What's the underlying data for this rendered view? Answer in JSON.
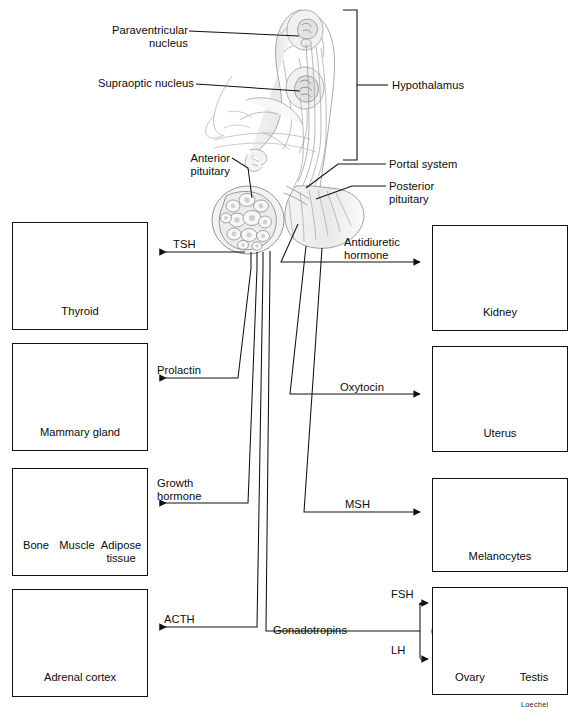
{
  "figure": {
    "signature": "Loechel",
    "line_color": "#111111",
    "box_border_color": "#111111",
    "background": "#ffffff"
  },
  "anatomy_labels": [
    {
      "id": "paraventricular-nucleus",
      "text": "Paraventricular\nnucleus",
      "align": "right",
      "x": 112,
      "y": 24
    },
    {
      "id": "supraoptic-nucleus",
      "text": "Supraoptic nucleus",
      "align": "right",
      "x": 98,
      "y": 77
    },
    {
      "id": "hypothalamus",
      "text": "Hypothalamus",
      "align": "left",
      "x": 392,
      "y": 81
    },
    {
      "id": "anterior-pituitary",
      "text": "Anterior\npituitary",
      "align": "right",
      "x": 146,
      "y": 153
    },
    {
      "id": "portal-system",
      "text": "Portal system",
      "align": "left",
      "x": 389,
      "y": 160
    },
    {
      "id": "posterior-pituitary",
      "text": "Posterior\npituitary",
      "align": "left",
      "x": 389,
      "y": 180
    }
  ],
  "hormone_labels": [
    {
      "id": "tsh",
      "text": "TSH",
      "x": 196,
      "y": 250
    },
    {
      "id": "prolactin",
      "text": "Prolactin",
      "x": 157,
      "y": 376
    },
    {
      "id": "growth-hormone",
      "text": "Growth\nhormone",
      "x": 157,
      "y": 484
    },
    {
      "id": "acth",
      "text": "ACTH",
      "x": 164,
      "y": 620
    },
    {
      "id": "antidiuretic-hormone",
      "text": "Antidiuretic\nhormone",
      "x": 344,
      "y": 251
    },
    {
      "id": "oxytocin",
      "text": "Oxytocin",
      "x": 340,
      "y": 382
    },
    {
      "id": "msh",
      "text": "MSH",
      "x": 345,
      "y": 502
    },
    {
      "id": "gonadotropins",
      "text": "Gonadotropins",
      "x": 273,
      "y": 624
    },
    {
      "id": "fsh",
      "text": "FSH",
      "x": 391,
      "y": 590
    },
    {
      "id": "lh",
      "text": "LH",
      "x": 391,
      "y": 650
    }
  ],
  "target_boxes": [
    {
      "id": "thyroid",
      "side": "left",
      "x": 12,
      "y": 222,
      "w": 136,
      "h": 108,
      "captions": [
        {
          "text": "Thyroid",
          "cx": 80,
          "y": 306
        }
      ],
      "organ": "thyroid-gland"
    },
    {
      "id": "mammary-gland",
      "side": "left",
      "x": 12,
      "y": 343,
      "w": 136,
      "h": 108,
      "captions": [
        {
          "text": "Mammary gland",
          "cx": 80,
          "y": 427
        }
      ],
      "organ": "mammary-gland"
    },
    {
      "id": "bone-muscle-adipose",
      "side": "left",
      "x": 12,
      "y": 468,
      "w": 136,
      "h": 108,
      "captions": [
        {
          "text": "Bone",
          "cx": 35,
          "y": 540
        },
        {
          "text": "Muscle",
          "cx": 76,
          "y": 540
        },
        {
          "text": "Adipose\ntissue",
          "cx": 120,
          "y": 540
        }
      ],
      "organ": "bone-muscle-adipose"
    },
    {
      "id": "adrenal-cortex",
      "side": "left",
      "x": 12,
      "y": 589,
      "w": 136,
      "h": 108,
      "captions": [
        {
          "text": "Adrenal cortex",
          "cx": 80,
          "y": 672
        }
      ],
      "organ": "adrenal-cortex"
    },
    {
      "id": "kidney",
      "side": "right",
      "x": 432,
      "y": 225,
      "w": 136,
      "h": 106,
      "captions": [
        {
          "text": "Kidney",
          "cx": 500,
          "y": 307
        }
      ],
      "organ": "kidney"
    },
    {
      "id": "uterus",
      "side": "right",
      "x": 432,
      "y": 346,
      "w": 136,
      "h": 106,
      "captions": [
        {
          "text": "Uterus",
          "cx": 500,
          "y": 428
        }
      ],
      "organ": "uterus"
    },
    {
      "id": "melanocytes",
      "side": "right",
      "x": 432,
      "y": 478,
      "w": 136,
      "h": 94,
      "captions": [
        {
          "text": "Melanocytes",
          "cx": 500,
          "y": 551
        }
      ],
      "organ": "melanocytes"
    },
    {
      "id": "gonads",
      "side": "right",
      "x": 432,
      "y": 587,
      "w": 136,
      "h": 108,
      "captions": [
        {
          "text": "Ovary",
          "cx": 470,
          "y": 672
        },
        {
          "text": "Testis",
          "cx": 534,
          "y": 672
        }
      ],
      "organ": "gonads"
    }
  ],
  "icon_names": {
    "head_drawing": "sagittal-head-hypothalamus-drawing",
    "pituitary": "pituitary-gland-drawing",
    "thyroid": "thyroid-gland-icon",
    "mammary": "mammary-gland-icon",
    "bone": "bone-icon",
    "muscle": "muscle-icon",
    "adipose": "adipose-tissue-icon",
    "adrenal": "adrenal-cortex-icon",
    "kidney": "kidney-icon",
    "uterus": "uterus-icon",
    "melanocytes": "melanocytes-tissue-icon",
    "ovary": "ovary-icon",
    "testis": "testis-icon"
  }
}
